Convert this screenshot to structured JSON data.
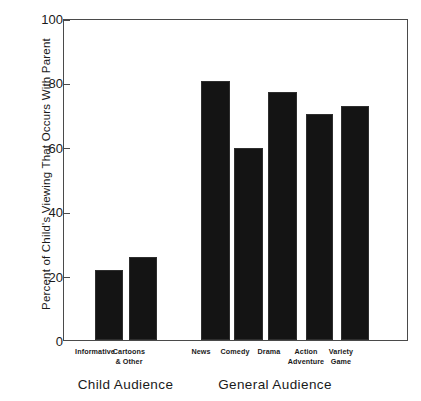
{
  "chart_data": {
    "type": "bar",
    "title": "",
    "xlabel": "",
    "ylabel": "Percent of Child's Viewing That Occurs With Parent",
    "ylim": [
      0,
      100
    ],
    "yticks": [
      0,
      20,
      40,
      60,
      80,
      100
    ],
    "grid": false,
    "legend": "none",
    "bar_color": "#141414",
    "groups": [
      {
        "name": "Child Audience",
        "categories": [
          "Informative",
          "Cartoons & Other"
        ],
        "values": [
          22,
          26
        ]
      },
      {
        "name": "General Audience",
        "categories": [
          "News",
          "Comedy",
          "Drama",
          "Action Adventure",
          "Variety Game"
        ],
        "values": [
          81,
          60,
          77.5,
          70.5,
          73
        ]
      }
    ],
    "categories": [
      "Informative",
      "Cartoons & Other",
      "News",
      "Comedy",
      "Drama",
      "Action Adventure",
      "Variety Game"
    ],
    "values": [
      22,
      26,
      81,
      60,
      77.5,
      70.5,
      73
    ]
  },
  "axis": {
    "y_title": "Percent of Child's Viewing That Occurs With Parent",
    "ticks": [
      {
        "value": "100"
      },
      {
        "value": "80"
      },
      {
        "value": "60"
      },
      {
        "value": "40"
      },
      {
        "value": "20"
      },
      {
        "value": "0"
      }
    ]
  },
  "bars": [
    {
      "label_line1": "Informative",
      "label_line2": "",
      "value": 22
    },
    {
      "label_line1": "Cartoons",
      "label_line2": "& Other",
      "value": 26
    },
    {
      "label_line1": "News",
      "label_line2": "",
      "value": 81
    },
    {
      "label_line1": "Comedy",
      "label_line2": "",
      "value": 60
    },
    {
      "label_line1": "Drama",
      "label_line2": "",
      "value": 77.5
    },
    {
      "label_line1": "Action",
      "label_line2": "Adventure",
      "value": 70.5
    },
    {
      "label_line1": "Variety",
      "label_line2": "Game",
      "value": 73
    }
  ],
  "groups": [
    {
      "title": "Child Audience"
    },
    {
      "title": "General Audience"
    }
  ]
}
